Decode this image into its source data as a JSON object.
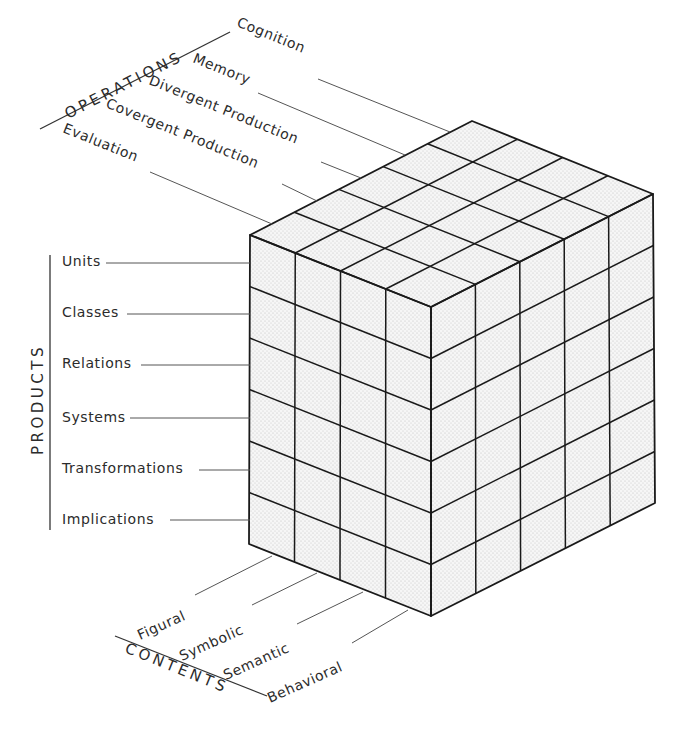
{
  "diagram": {
    "type": "structure-of-intellect-cube",
    "operations": {
      "title": "OPERATIONS",
      "items": [
        "Cognition",
        "Memory",
        "Divergent Production",
        "Covergent Production",
        "Evaluation"
      ]
    },
    "products": {
      "title": "PRODUCTS",
      "items": [
        "Units",
        "Classes",
        "Relations",
        "Systems",
        "Transformations",
        "Implications"
      ]
    },
    "contents": {
      "title": "CONTENTS",
      "items": [
        "Figural",
        "Symbolic",
        "Semantic",
        "Behavioral"
      ]
    },
    "colors": {
      "line": "#1a1a1a",
      "face_fill": "#f4f4f4",
      "stipple": "#bdbdbd",
      "text": "#2b2b2b"
    }
  }
}
